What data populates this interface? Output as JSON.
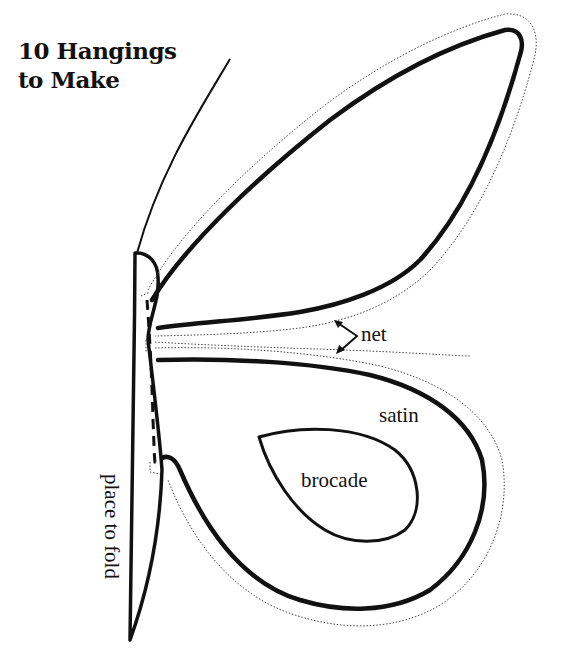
{
  "title": {
    "line1": "10 Hangings",
    "line2": "to Make"
  },
  "pattern": {
    "name": "butterfly-wing-pattern",
    "labels": {
      "net": "net",
      "satin": "satin",
      "brocade": "brocade",
      "fold": "place to fold"
    },
    "colors": {
      "ink": "#111111",
      "paper": "#ffffff"
    }
  }
}
